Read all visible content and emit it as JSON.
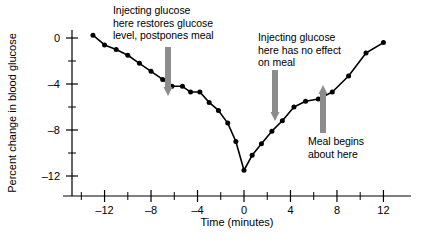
{
  "chart_data": {
    "type": "line",
    "title": "",
    "xlabel": "Time (minutes)",
    "ylabel": "Percent change in blood glucose",
    "xlim": [
      -14,
      13.5
    ],
    "ylim": [
      -13,
      1.5
    ],
    "xticks": [
      -12,
      -8,
      -4,
      0,
      4,
      8,
      12
    ],
    "xtick_labels": [
      "–12",
      "–8",
      "–4",
      "0",
      "4",
      "8",
      "12"
    ],
    "yticks": [
      0,
      -4,
      -8,
      -12
    ],
    "ytick_labels": [
      "0",
      "–4",
      "–8",
      "–12"
    ],
    "minor_xticks": [
      -14,
      -10,
      -6,
      -2,
      2,
      6,
      10
    ],
    "minor_yticks": [
      -2,
      -6,
      -10
    ],
    "grid": false,
    "legend": null,
    "series": [
      {
        "name": "Blood glucose",
        "marker": "circle",
        "color": "#000000",
        "x": [
          -13.0,
          -12.0,
          -11.0,
          -10.0,
          -9.0,
          -8.0,
          -7.0,
          -6.2,
          -5.3,
          -4.6,
          -3.8,
          -3.0,
          -2.2,
          -1.4,
          -0.7,
          0.0,
          0.7,
          1.5,
          2.4,
          3.3,
          4.3,
          5.3,
          6.4,
          7.6,
          9.0,
          10.5,
          12.0
        ],
        "y": [
          0.25,
          -0.6,
          -1.0,
          -1.5,
          -2.2,
          -2.9,
          -3.6,
          -4.2,
          -4.2,
          -4.7,
          -4.7,
          -5.6,
          -6.3,
          -7.4,
          -9.0,
          -11.5,
          -10.2,
          -9.2,
          -8.1,
          -7.2,
          -6.0,
          -5.5,
          -5.3,
          -4.7,
          -3.3,
          -1.3,
          -0.4
        ]
      }
    ]
  },
  "annotations": [
    {
      "id": "injection-restores",
      "text": "Injecting glucose\nhere restores glucose\nlevel, postpones meal",
      "arrow": {
        "direction": "down",
        "x": 168,
        "y_top": 47,
        "y_bottom": 96,
        "color": "#8c8c8c"
      }
    },
    {
      "id": "injection-no-effect",
      "text": "Injecting glucose\nhere has no effect\non meal",
      "arrow": {
        "direction": "down",
        "x": 275,
        "y_top": 70,
        "y_bottom": 121,
        "color": "#8c8c8c"
      }
    },
    {
      "id": "meal-begins",
      "text": "Meal begins\nabout here",
      "arrow": {
        "direction": "up",
        "x": 323,
        "y_top": 85,
        "y_bottom": 133,
        "color": "#8c8c8c"
      }
    }
  ],
  "axes": {
    "x_title": "Time (minutes)",
    "y_title": "Percent change in blood glucose"
  }
}
